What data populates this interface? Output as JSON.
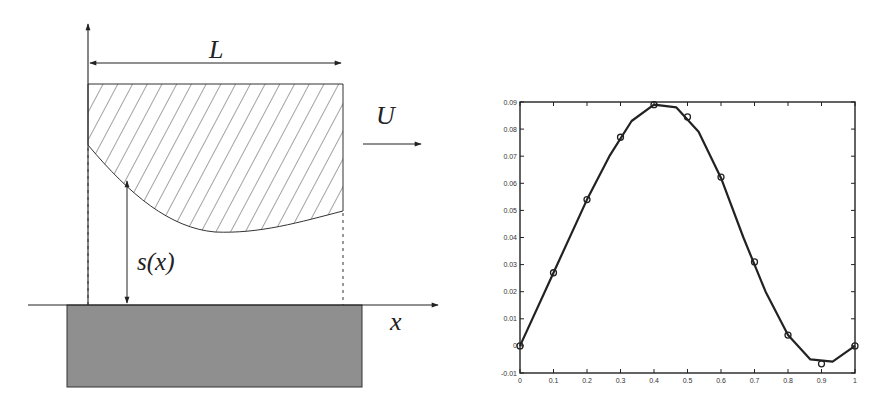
{
  "diagram": {
    "labels": {
      "length": "L",
      "velocity": "U",
      "gap": "s(x)",
      "x_axis": "x"
    },
    "colors": {
      "stroke": "#222222",
      "ground_fill": "#8f8f8f",
      "hatch": "#333333",
      "background": "#ffffff"
    },
    "geometry": {
      "slider_top_y": 84,
      "slider_left_x": 88,
      "slider_right_x": 343,
      "slider_left_bottom_y": 145,
      "slider_right_bottom_y": 211,
      "ground_top_y": 305,
      "ground_left_x": 67,
      "ground_right_x": 362,
      "ground_bottom_y": 387
    }
  },
  "chart_data": {
    "type": "line",
    "title": "",
    "xlabel": "",
    "ylabel": "",
    "xlim": [
      0,
      1
    ],
    "ylim": [
      -0.01,
      0.09
    ],
    "grid": false,
    "legend": null,
    "x_ticks": [
      "0",
      "0.1",
      "0.2",
      "0.3",
      "0.4",
      "0.5",
      "0.6",
      "0.7",
      "0.8",
      "0.9",
      "1"
    ],
    "y_ticks": [
      "-0.01",
      "0",
      "0.01",
      "0.02",
      "0.03",
      "0.04",
      "0.05",
      "0.06",
      "0.07",
      "0.08",
      "0.09"
    ],
    "series": [
      {
        "name": "solid curve",
        "style": "line",
        "x": [
          0,
          0.1,
          0.2,
          0.267,
          0.333,
          0.4,
          0.467,
          0.533,
          0.6,
          0.667,
          0.733,
          0.8,
          0.867,
          0.933,
          1.0
        ],
        "values": [
          0,
          0.027,
          0.054,
          0.07,
          0.083,
          0.089,
          0.088,
          0.079,
          0.062,
          0.04,
          0.02,
          0.004,
          -0.005,
          -0.0058,
          0.0
        ]
      },
      {
        "name": "circle markers",
        "style": "markers",
        "x": [
          0,
          0.1,
          0.2,
          0.3,
          0.4,
          0.5,
          0.6,
          0.7,
          0.8,
          0.9,
          1.0
        ],
        "values": [
          0,
          0.027,
          0.054,
          0.077,
          0.089,
          0.0845,
          0.0623,
          0.031,
          0.004,
          -0.0066,
          0.0
        ]
      }
    ],
    "plot_box": {
      "left": 520,
      "right": 855,
      "top": 102,
      "bottom": 373
    }
  }
}
